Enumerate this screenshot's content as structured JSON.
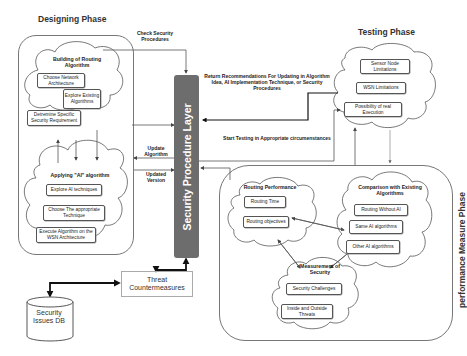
{
  "phases": {
    "designing": {
      "title": "Designing Phase",
      "building_cloud": {
        "title": "Building of Routing Algorithm",
        "items": [
          "Choose Network Architecture",
          "Explore Existing Algorithms",
          "Detremine Specific Security Requirement"
        ]
      },
      "applying_cloud": {
        "title": "Applying \"AI\" algorithm",
        "items": [
          "Explore AI techniques",
          "Choose The appropriate Technique",
          "Execute Algorithm on the WSN Architecture"
        ]
      }
    },
    "testing": {
      "title": "Testing Phase",
      "items": [
        "Sensor Node Limitations",
        "WSN Limitations",
        "Possibility of real Execution"
      ]
    },
    "performance": {
      "title": "performance Measure Phase",
      "routing_cloud": {
        "title": "Routing Performance",
        "items": [
          "Routing Time",
          "Routing objectives"
        ]
      },
      "comparison_cloud": {
        "title": "Comparison with Existing Algorithms",
        "items": [
          "Routing Without AI",
          "Same AI algorithms",
          "Other AI algorithms"
        ]
      },
      "security_cloud": {
        "title": "Measurement of Security",
        "items": [
          "Security Challenges",
          "Inside and Outside Threats"
        ]
      }
    }
  },
  "central_layer": {
    "label": "Security Procedure Layer",
    "color": "#6d6d6d"
  },
  "threat_box": {
    "label": "Threat Countermeasures"
  },
  "database": {
    "label": "Security Issues DB"
  },
  "flow_labels": {
    "check_security": "Check Security Procedures",
    "return_recommendations": "Return Recommendations For Updating in Algorithm Idea, AI Implementation Technique, or Security Procedures",
    "start_testing": "Start Testing in Appropriate circumenstances",
    "update_algorithm": "Update Algorithm",
    "updated_version": "Updated Version"
  }
}
